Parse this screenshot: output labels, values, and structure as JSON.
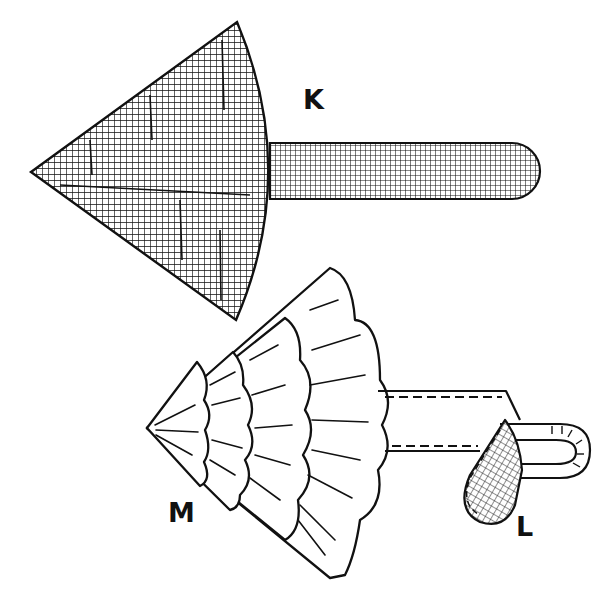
{
  "figure": {
    "colors": {
      "ink": "#111111",
      "paper": "#ffffff",
      "ghost_text": "#e9e9e9"
    }
  },
  "labels": {
    "k": "K",
    "m": "M",
    "l": "L"
  },
  "parts": [
    {
      "id": "K",
      "name": "fan-shaped pattern piece with handle strip",
      "fill": "crosshatch"
    },
    {
      "id": "M",
      "name": "gathered ruffle fan (four scalloped tiers)",
      "fill": "outline with pleat lines"
    },
    {
      "id": "L",
      "name": "ribbon strip with looped end and crosshatched tab",
      "fill": "dashed stitching, crosshatch tab"
    }
  ]
}
